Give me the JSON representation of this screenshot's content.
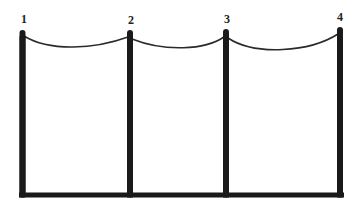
{
  "diagram": {
    "colors": {
      "background": "#ffffff",
      "structure": "#1a1a1a",
      "cable": "#2a2a2a",
      "label": "#222222"
    },
    "base": {
      "x1": 20,
      "x2": 343,
      "y": 195,
      "thickness": 5
    },
    "poles": [
      {
        "id": "1",
        "label": "1",
        "x": 22.5,
        "top": 30,
        "label_x": 24,
        "label_y": 13
      },
      {
        "id": "2",
        "label": "2",
        "x": 130,
        "top": 30,
        "label_x": 131,
        "label_y": 14
      },
      {
        "id": "3",
        "label": "3",
        "x": 226,
        "top": 29,
        "label_x": 227,
        "label_y": 13
      },
      {
        "id": "4",
        "label": "4",
        "x": 340,
        "top": 27,
        "label_x": 340,
        "label_y": 11
      }
    ],
    "cables": [
      {
        "from": "1",
        "to": "2",
        "start": [
          24,
          36
        ],
        "ctrl1": [
          50,
          52
        ],
        "ctrl2": [
          95,
          49
        ],
        "end": [
          128,
          37
        ]
      },
      {
        "from": "2",
        "to": "3",
        "start": [
          132,
          39
        ],
        "ctrl1": [
          165,
          52
        ],
        "ctrl2": [
          205,
          50
        ],
        "end": [
          224,
          37
        ]
      },
      {
        "from": "3",
        "to": "4",
        "start": [
          228,
          38
        ],
        "ctrl1": [
          255,
          56
        ],
        "ctrl2": [
          310,
          52
        ],
        "end": [
          338,
          34
        ]
      }
    ]
  }
}
